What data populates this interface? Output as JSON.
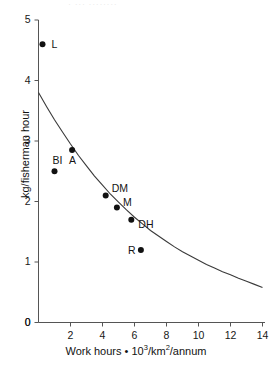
{
  "figure": {
    "top_partial_text": "· ···            ········",
    "background_color": "#ffffff",
    "axis_color": "#555555",
    "curve_color": "#3a3a3a",
    "point_color": "#111111"
  },
  "axes": {
    "y_title": "kg/fisherman hour",
    "x_title_prefix": "Work hours • 10",
    "x_title_exp": "3",
    "x_title_mid": "/km",
    "x_title_exp2": "2",
    "x_title_suffix": "/annum",
    "y_ticks": [
      "0",
      "1",
      "2",
      "3",
      "4",
      "5"
    ],
    "x_ticks": [
      "0",
      "2",
      "4",
      "6",
      "8",
      "10",
      "12",
      "14"
    ]
  },
  "chart_data": {
    "type": "scatter",
    "title": "",
    "xlabel": "Work hours • 10³/km²/annum",
    "ylabel": "kg/fisherman hour",
    "xlim": [
      0,
      14
    ],
    "ylim": [
      0,
      5
    ],
    "xticks": [
      0,
      2,
      4,
      6,
      8,
      10,
      12,
      14
    ],
    "yticks": [
      0,
      1,
      2,
      3,
      4,
      5
    ],
    "grid": false,
    "legend": "none",
    "points": [
      {
        "label": "L",
        "x": 0.25,
        "y": 4.6,
        "label_dx": 9,
        "label_dy": -5
      },
      {
        "label": "BI",
        "x": 1.0,
        "y": 2.5,
        "label_dx": -2,
        "label_dy": -16
      },
      {
        "label": "A",
        "x": 2.1,
        "y": 2.85,
        "label_dx": -3,
        "label_dy": 5
      },
      {
        "label": "DM",
        "x": 4.2,
        "y": 2.1,
        "label_dx": 6,
        "label_dy": -12
      },
      {
        "label": "M",
        "x": 4.9,
        "y": 1.9,
        "label_dx": 6,
        "label_dy": -11
      },
      {
        "label": "DH",
        "x": 5.8,
        "y": 1.7,
        "label_dx": 7,
        "label_dy": -1
      },
      {
        "label": "R",
        "x": 6.4,
        "y": 1.2,
        "label_dx": -13,
        "label_dy": -5
      }
    ],
    "fitted_curve": {
      "description": "monotonically decreasing fitted catch-per-effort curve",
      "x": [
        0.0,
        0.5,
        1.0,
        1.5,
        2.0,
        2.5,
        3.0,
        3.5,
        4.0,
        4.5,
        5.0,
        5.5,
        6.0,
        6.5,
        7.0,
        7.5,
        8.0,
        8.5,
        9.0,
        9.5,
        10.0,
        10.5,
        11.0,
        11.5,
        12.0,
        12.5,
        13.0,
        13.5,
        14.0
      ],
      "y": [
        3.8,
        3.57,
        3.35,
        3.15,
        2.95,
        2.76,
        2.59,
        2.42,
        2.27,
        2.12,
        1.99,
        1.86,
        1.74,
        1.63,
        1.52,
        1.43,
        1.34,
        1.25,
        1.17,
        1.1,
        1.03,
        0.96,
        0.9,
        0.84,
        0.79,
        0.73,
        0.68,
        0.63,
        0.58
      ]
    }
  }
}
